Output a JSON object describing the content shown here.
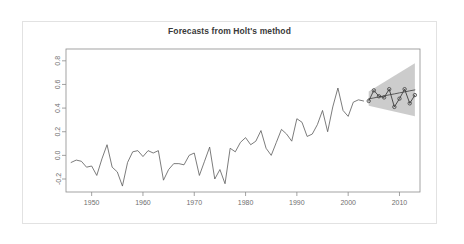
{
  "window": {
    "title": "Forecasts from Holt's method"
  },
  "chart_data": {
    "type": "line",
    "title": "Forecasts from Holt's method",
    "xlabel": "",
    "ylabel": "",
    "xlim": [
      1945,
      2014
    ],
    "ylim": [
      -0.31,
      0.9
    ],
    "grid": false,
    "legend": false,
    "legend_position": "none",
    "x_ticks": [
      1950,
      1960,
      1970,
      1980,
      1990,
      2000,
      2010
    ],
    "x_tick_labels": [
      "1950",
      "1960",
      "1970",
      "1980",
      "1990",
      "2000",
      "2010"
    ],
    "y_ticks": [
      -0.2,
      0.0,
      0.2,
      0.4,
      0.6,
      0.8
    ],
    "y_tick_labels": [
      "-0.2",
      "0.0",
      "0.2",
      "0.4",
      "0.6",
      "0.8"
    ],
    "colors": {
      "historical_line": "#5a5a5a",
      "forecast_line": "#4d4d4d",
      "observed_overlay": "#3d3d3d",
      "prediction_interval_band": "#c9c9c9",
      "axis": "#8c8c8c",
      "title_text": "#3a3a3a",
      "tick_text": "#6f6f6f",
      "outer_border": "#e2e2e2",
      "background": "#ffffff"
    },
    "series": [
      {
        "name": "historical",
        "type": "line",
        "x": [
          1946,
          1947,
          1948,
          1949,
          1950,
          1951,
          1952,
          1953,
          1954,
          1955,
          1956,
          1957,
          1958,
          1959,
          1960,
          1961,
          1962,
          1963,
          1964,
          1965,
          1966,
          1967,
          1968,
          1969,
          1970,
          1971,
          1972,
          1973,
          1974,
          1975,
          1976,
          1977,
          1978,
          1979,
          1980,
          1981,
          1982,
          1983,
          1984,
          1985,
          1986,
          1987,
          1988,
          1989,
          1990,
          1991,
          1992,
          1993,
          1994,
          1995,
          1996,
          1997,
          1998,
          1999,
          2000,
          2001,
          2002,
          2003
        ],
        "values": [
          -0.06,
          -0.04,
          -0.05,
          -0.1,
          -0.09,
          -0.17,
          -0.03,
          0.09,
          -0.1,
          -0.14,
          -0.26,
          -0.06,
          0.03,
          0.04,
          -0.01,
          0.04,
          0.02,
          0.04,
          -0.21,
          -0.12,
          -0.07,
          -0.07,
          -0.08,
          0.0,
          0.02,
          -0.17,
          -0.05,
          0.07,
          -0.2,
          -0.12,
          -0.24,
          0.06,
          0.03,
          0.11,
          0.15,
          0.09,
          0.12,
          0.21,
          0.06,
          0.0,
          0.11,
          0.22,
          0.18,
          0.12,
          0.31,
          0.28,
          0.16,
          0.18,
          0.26,
          0.38,
          0.2,
          0.41,
          0.57,
          0.38,
          0.33,
          0.45,
          0.47,
          0.46
        ]
      },
      {
        "name": "point-forecast",
        "type": "line",
        "x": [
          2004,
          2005,
          2006,
          2007,
          2008,
          2009,
          2010,
          2011,
          2012,
          2013
        ],
        "values": [
          0.478,
          0.486,
          0.495,
          0.503,
          0.512,
          0.52,
          0.529,
          0.537,
          0.546,
          0.554
        ]
      },
      {
        "name": "observed-over-forecast",
        "type": "line-markers",
        "x": [
          2004,
          2005,
          2006,
          2007,
          2008,
          2009,
          2010,
          2011,
          2012,
          2013
        ],
        "values": [
          0.46,
          0.55,
          0.5,
          0.49,
          0.56,
          0.41,
          0.48,
          0.56,
          0.44,
          0.51
        ]
      }
    ],
    "prediction_interval": {
      "name": "prediction-interval-band",
      "x": [
        2004,
        2013
      ],
      "lower": [
        0.42,
        0.33
      ],
      "upper": [
        0.54,
        0.78
      ]
    }
  }
}
